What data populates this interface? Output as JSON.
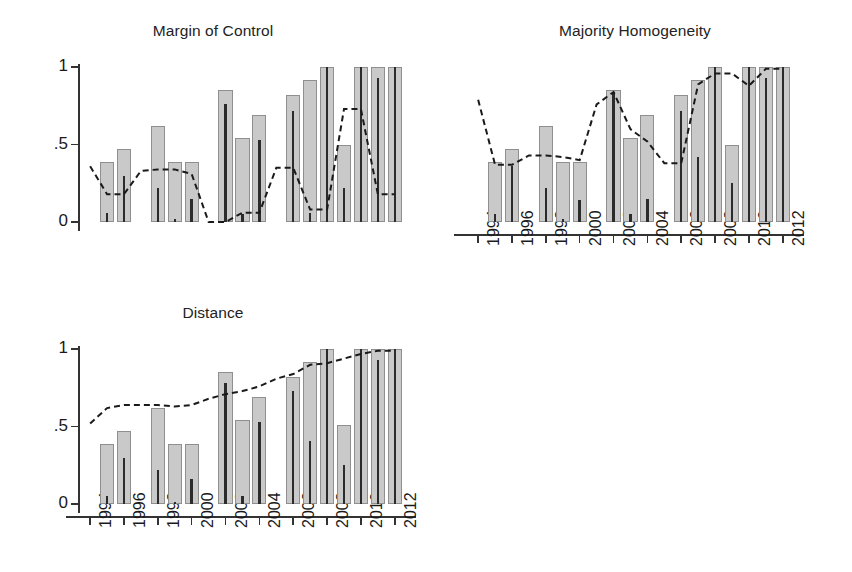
{
  "figure": {
    "width": 852,
    "height": 572,
    "background": "#ffffff",
    "bar_fill": "#c9c9c9",
    "bar_edge": "#8f8f8f",
    "inner_line_color": "#2b2b2b",
    "dash_color": "#1a1a1a"
  },
  "chart_data": [
    {
      "type": "bar",
      "title": "Margin of Control",
      "xlabel": "",
      "ylabel": "",
      "ylim": [
        0,
        1.06
      ],
      "yticks": [
        0,
        0.5,
        1
      ],
      "ytick_labels": [
        "0",
        ".5",
        "1"
      ],
      "xlim": [
        1993.4,
        2012.9
      ],
      "xticks": [
        1994,
        1996,
        1998,
        2000,
        2002,
        2004,
        2006,
        2008,
        2010,
        2012
      ],
      "xtick_labels": [
        "1994",
        "1996",
        "1998",
        "2000",
        "2002",
        "2004",
        "2006",
        "2008",
        "2010",
        "2012"
      ],
      "grid": false,
      "legend": "none",
      "x": [
        1995,
        1996,
        1998,
        1999,
        2000,
        2002,
        2003,
        2004,
        2006,
        2007,
        2008,
        2009,
        2010,
        2011,
        2012
      ],
      "values": [
        0.39,
        0.47,
        0.62,
        0.39,
        0.39,
        0.85,
        0.54,
        0.69,
        0.82,
        0.92,
        1.0,
        0.5,
        1.0,
        1.0,
        1.0
      ],
      "inner_values": [
        0.06,
        0.3,
        0.22,
        0.02,
        0.15,
        0.76,
        0.05,
        0.53,
        0.72,
        0.06,
        1.0,
        0.22,
        1.0,
        0.93,
        1.0
      ],
      "line": {
        "style": "dashed",
        "x": [
          1994,
          1995,
          1996,
          1997,
          1998,
          1999,
          2000,
          2001,
          2002,
          2003,
          2004,
          2005,
          2006,
          2007,
          2008,
          2009,
          2010,
          2011,
          2012
        ],
        "y": [
          0.36,
          0.18,
          0.18,
          0.33,
          0.34,
          0.34,
          0.31,
          0.0,
          0.0,
          0.06,
          0.06,
          0.35,
          0.35,
          0.08,
          0.08,
          0.73,
          0.73,
          0.18,
          0.18
        ]
      }
    },
    {
      "type": "bar",
      "title": "Majority Homogeneity",
      "xlabel": "",
      "ylabel": "",
      "ylim": [
        0,
        1.06
      ],
      "yticks": [
        0,
        0.5,
        1
      ],
      "ytick_labels": [
        "0",
        ".5",
        "1"
      ],
      "xlim": [
        1993.4,
        2012.9
      ],
      "xticks": [
        1994,
        1996,
        1998,
        2000,
        2002,
        2004,
        2006,
        2008,
        2010,
        2012
      ],
      "xtick_labels": [
        "1994",
        "1996",
        "1998",
        "2000",
        "2002",
        "2004",
        "2006",
        "2008",
        "2010",
        "2012"
      ],
      "grid": false,
      "legend": "none",
      "x": [
        1995,
        1996,
        1998,
        1999,
        2000,
        2002,
        2003,
        2004,
        2006,
        2007,
        2008,
        2009,
        2010,
        2011,
        2012
      ],
      "values": [
        0.39,
        0.47,
        0.62,
        0.39,
        0.39,
        0.85,
        0.54,
        0.69,
        0.82,
        0.92,
        1.0,
        0.5,
        1.0,
        1.0,
        1.0
      ],
      "inner_values": [
        0.05,
        0.36,
        0.22,
        0.02,
        0.14,
        0.84,
        0.05,
        0.15,
        0.72,
        0.42,
        1.0,
        0.25,
        1.0,
        0.93,
        1.0
      ],
      "line": {
        "style": "dashed",
        "x": [
          1994,
          1995,
          1996,
          1997,
          1998,
          1999,
          2000,
          2001,
          2002,
          2003,
          2004,
          2005,
          2006,
          2007,
          2008,
          2009,
          2010,
          2011,
          2012
        ],
        "y": [
          0.79,
          0.37,
          0.37,
          0.43,
          0.43,
          0.42,
          0.4,
          0.76,
          0.84,
          0.6,
          0.52,
          0.38,
          0.38,
          0.89,
          0.96,
          0.96,
          0.88,
          0.99,
          0.99
        ]
      }
    },
    {
      "type": "bar",
      "title": "Distance",
      "xlabel": "",
      "ylabel": "",
      "ylim": [
        0,
        1.06
      ],
      "yticks": [
        0,
        0.5,
        1
      ],
      "ytick_labels": [
        "0",
        ".5",
        "1"
      ],
      "xlim": [
        1993.4,
        2012.9
      ],
      "xticks": [
        1994,
        1996,
        1998,
        2000,
        2002,
        2004,
        2006,
        2008,
        2010,
        2012
      ],
      "xtick_labels": [
        "1994",
        "1996",
        "1998",
        "2000",
        "2002",
        "2004",
        "2006",
        "2008",
        "2010",
        "2012"
      ],
      "grid": false,
      "legend": "none",
      "x": [
        1995,
        1996,
        1998,
        1999,
        2000,
        2002,
        2003,
        2004,
        2006,
        2007,
        2008,
        2009,
        2010,
        2011,
        2012
      ],
      "values": [
        0.39,
        0.47,
        0.62,
        0.39,
        0.39,
        0.85,
        0.54,
        0.69,
        0.82,
        0.92,
        1.0,
        0.51,
        1.0,
        1.0,
        1.0
      ],
      "inner_values": [
        0.05,
        0.3,
        0.22,
        0.01,
        0.16,
        0.78,
        0.05,
        0.53,
        0.73,
        0.41,
        1.0,
        0.25,
        1.0,
        0.93,
        1.0
      ],
      "line": {
        "style": "dashed",
        "x": [
          1994,
          1995,
          1996,
          1997,
          1998,
          1999,
          2000,
          2001,
          2002,
          2003,
          2004,
          2005,
          2006,
          2007,
          2008,
          2009,
          2010,
          2011,
          2012
        ],
        "y": [
          0.52,
          0.62,
          0.64,
          0.64,
          0.64,
          0.63,
          0.64,
          0.68,
          0.71,
          0.73,
          0.76,
          0.81,
          0.84,
          0.9,
          0.91,
          0.94,
          0.97,
          0.99,
          0.99
        ]
      }
    }
  ]
}
